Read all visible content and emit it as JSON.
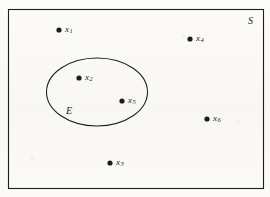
{
  "figure": {
    "type": "venn-set-diagram",
    "width": 270,
    "height": 197,
    "background_color": "#fbfaf7",
    "ink_color": "#1d1d1d"
  },
  "sample_space": {
    "label": "S",
    "shape": "rectangle",
    "label_x": 248,
    "label_y": 16,
    "rect": {
      "x": 8,
      "y": 9,
      "width": 255,
      "height": 179
    }
  },
  "event": {
    "label": "E",
    "shape": "ellipse",
    "label_x": 66,
    "label_y": 106,
    "ellipse": {
      "cx": 97,
      "cy": 92,
      "rx": 50.5,
      "ry": 34
    }
  },
  "points": [
    {
      "name": "x1",
      "base": "x",
      "subscript": "1",
      "cx": 59,
      "cy": 30,
      "label_x": 65,
      "label_y": 25,
      "in_event": false
    },
    {
      "name": "x2",
      "base": "x",
      "subscript": "2",
      "cx": 79,
      "cy": 78,
      "label_x": 85,
      "label_y": 73,
      "in_event": true
    },
    {
      "name": "x3",
      "base": "x",
      "subscript": "3",
      "cx": 110,
      "cy": 163,
      "label_x": 116,
      "label_y": 158,
      "in_event": false
    },
    {
      "name": "x4",
      "base": "x",
      "subscript": "4",
      "cx": 190,
      "cy": 39,
      "label_x": 196,
      "label_y": 34,
      "in_event": false
    },
    {
      "name": "x5",
      "base": "x",
      "subscript": "5",
      "cx": 122,
      "cy": 101,
      "label_x": 128,
      "label_y": 96,
      "in_event": true
    },
    {
      "name": "x6",
      "base": "x",
      "subscript": "6",
      "cx": 207,
      "cy": 119,
      "label_x": 213,
      "label_y": 114,
      "in_event": false
    }
  ],
  "point_radius": 2.6
}
